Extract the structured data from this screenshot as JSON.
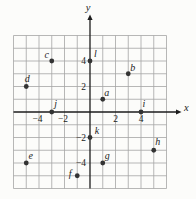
{
  "figure": {
    "background": "#fcfcfa",
    "grid_color": "#a4a4a4",
    "axis_color": "#1c1c1c",
    "point_color": "#333333",
    "text_color": "#1c1c1c"
  },
  "chart_data": {
    "type": "scatter",
    "title": "",
    "xlabel": "x",
    "ylabel": "y",
    "xlim": [
      -6,
      6
    ],
    "ylim": [
      -6,
      6
    ],
    "grid": true,
    "x_ticks": [
      {
        "value": -4,
        "label": "−4"
      },
      {
        "value": -2,
        "label": "−2"
      },
      {
        "value": 2,
        "label": "2"
      },
      {
        "value": 4,
        "label": "4"
      }
    ],
    "y_ticks": [
      {
        "value": 4,
        "label": "4"
      },
      {
        "value": 2,
        "label": "2"
      },
      {
        "value": -2,
        "label": "−2"
      },
      {
        "value": -4,
        "label": "−4"
      }
    ],
    "points": [
      {
        "label": "a",
        "x": 1,
        "y": 1,
        "label_dx": 4,
        "label_dy": -6
      },
      {
        "label": "b",
        "x": 3,
        "y": 3,
        "label_dx": 4.5,
        "label_dy": -5.5
      },
      {
        "label": "c",
        "x": -3,
        "y": 4,
        "label_dx": -5,
        "label_dy": -6.5
      },
      {
        "label": "d",
        "x": -5,
        "y": 2,
        "label_dx": 1,
        "label_dy": -8
      },
      {
        "label": "e",
        "x": -5,
        "y": -4,
        "label_dx": 4.5,
        "label_dy": -7
      },
      {
        "label": "f",
        "x": -1,
        "y": -5,
        "label_dx": -7,
        "label_dy": -2
      },
      {
        "label": "g",
        "x": 1,
        "y": -4,
        "label_dx": 4.5,
        "label_dy": -7.5
      },
      {
        "label": "h",
        "x": 5,
        "y": -3,
        "label_dx": 4,
        "label_dy": -8
      },
      {
        "label": "i",
        "x": 4,
        "y": 0,
        "label_dx": 3,
        "label_dy": -8
      },
      {
        "label": "j",
        "x": -3,
        "y": 0,
        "label_dx": 4,
        "label_dy": -8
      },
      {
        "label": "k",
        "x": 0,
        "y": -2,
        "label_dx": 7,
        "label_dy": -7
      },
      {
        "label": "l",
        "x": 0,
        "y": 4,
        "label_dx": 5.5,
        "label_dy": -7
      }
    ]
  }
}
